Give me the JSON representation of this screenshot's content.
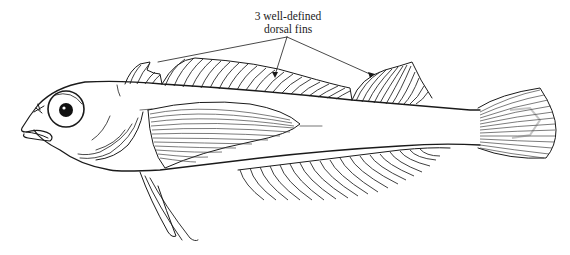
{
  "figure": {
    "annotation": {
      "line1": "3 well-defined",
      "line2": "dorsal fins",
      "pointers": 3
    },
    "colors": {
      "background": "#ffffff",
      "ink": "#1a1a1a"
    }
  }
}
